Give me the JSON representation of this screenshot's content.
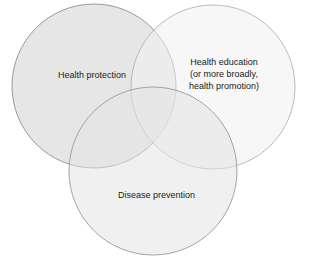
{
  "diagram": {
    "type": "venn",
    "circles": [
      {
        "id": "health-protection",
        "label": "Health protection",
        "cx": 94,
        "cy": 86,
        "r": 82,
        "fill": "#d9d9d9",
        "opacity": 0.55
      },
      {
        "id": "health-education",
        "label_lines": [
          "Health education",
          "(or more broadly,",
          "health promotion)"
        ],
        "cx": 213,
        "cy": 87,
        "r": 82,
        "fill": "#f2f2f2",
        "opacity": 0.5
      },
      {
        "id": "disease-prevention",
        "label": "Disease prevention",
        "cx": 153,
        "cy": 171,
        "r": 84,
        "fill": "#e6e6e6",
        "opacity": 0.55
      }
    ],
    "stroke_color": "#9a9a9a"
  }
}
